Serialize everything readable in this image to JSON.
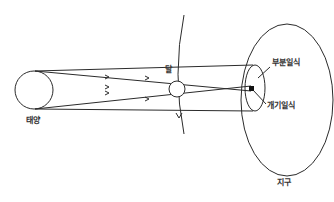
{
  "diagram": {
    "title": "",
    "labels": {
      "sun": "태양",
      "moon": "달",
      "earth": "지구",
      "partial_eclipse": "부분일식",
      "total_eclipse": "개기일식"
    },
    "colors": {
      "stroke": "#2b2b2b",
      "text": "#333333",
      "background": "#ffffff"
    }
  }
}
